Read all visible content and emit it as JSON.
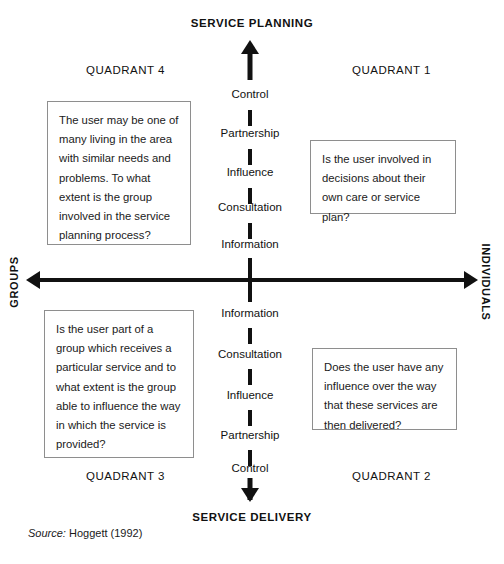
{
  "diagram": {
    "axis": {
      "vertical": {
        "top_pole": "SERVICE PLANNING",
        "bottom_pole": "SERVICE DELIVERY"
      },
      "horizontal": {
        "left_pole": "GROUPS",
        "right_pole": "INDIVIDUALS"
      }
    },
    "ladder_upper": [
      {
        "label": "Control"
      },
      {
        "label": "Partnership"
      },
      {
        "label": "Influence"
      },
      {
        "label": "Consultation"
      },
      {
        "label": "Information"
      }
    ],
    "ladder_lower": [
      {
        "label": "Information"
      },
      {
        "label": "Consultation"
      },
      {
        "label": "Influence"
      },
      {
        "label": "Partnership"
      },
      {
        "label": "Control"
      }
    ],
    "quadrants": {
      "q1": {
        "heading": "QUADRANT 1",
        "text": "Is the user involved in decisions about their own care or service plan?"
      },
      "q2": {
        "heading": "QUADRANT 2",
        "text": "Does the user have any influence over the way that these services are then delivered?"
      },
      "q3": {
        "heading": "QUADRANT 3",
        "text": "Is the user part of a group which receives a particular service and to what extent is the group able to influence the way in which the service is provided?"
      },
      "q4": {
        "heading": "QUADRANT 4",
        "text": "The user may be one of many living in the area with similar needs and problems. To what extent is the group involved in the service planning process?"
      }
    },
    "source": {
      "prefix": "Source:",
      "citation": "Hoggett (1992)"
    },
    "colors": {
      "ink": "#111111",
      "box_border": "#8e8e8e",
      "background": "#ffffff"
    }
  }
}
